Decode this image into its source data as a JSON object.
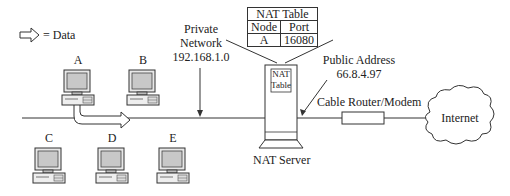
{
  "legend": {
    "icon": "hollow-right-arrow-icon",
    "label": "= Data"
  },
  "private_network": {
    "line1": "Private",
    "line2": "Network",
    "address": "192.168.1.0"
  },
  "nat_table": {
    "title": "NAT Table",
    "headers": [
      "Node",
      "Port"
    ],
    "rows": [
      [
        "A",
        "16080"
      ]
    ]
  },
  "nat_server": {
    "label": "NAT Server",
    "inner_label_1": "NAT",
    "inner_label_2": "Table"
  },
  "public_address": {
    "line1": "Public Address",
    "address": "66.8.4.97"
  },
  "cable_router": {
    "label": "Cable Router/Modem"
  },
  "internet": {
    "label": "Internet"
  },
  "computers": [
    {
      "name": "A"
    },
    {
      "name": "B"
    },
    {
      "name": "C"
    },
    {
      "name": "D"
    },
    {
      "name": "E"
    }
  ]
}
